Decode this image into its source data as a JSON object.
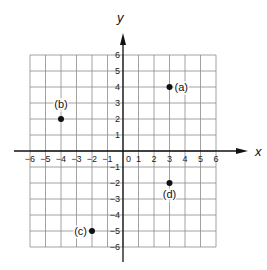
{
  "chart_data": {
    "type": "scatter",
    "title": "",
    "xlabel": "x",
    "ylabel": "y",
    "xlim": [
      -6,
      6
    ],
    "ylim": [
      -6,
      6
    ],
    "grid": true,
    "x_ticks": [
      -6,
      -5,
      -4,
      -3,
      -2,
      -1,
      0,
      1,
      2,
      3,
      4,
      5,
      6
    ],
    "y_ticks": [
      -6,
      -5,
      -4,
      -3,
      -2,
      -1,
      1,
      2,
      3,
      4,
      5,
      6
    ],
    "points": [
      {
        "label": "(a)",
        "x": 3,
        "y": 4
      },
      {
        "label": "(b)",
        "x": -4,
        "y": 2
      },
      {
        "label": "(c)",
        "x": -2,
        "y": -5
      },
      {
        "label": "(d)",
        "x": 3,
        "y": -2
      }
    ]
  },
  "colors": {
    "grid": "#8a8a8a",
    "axis": "#111111",
    "point": "#111111"
  }
}
